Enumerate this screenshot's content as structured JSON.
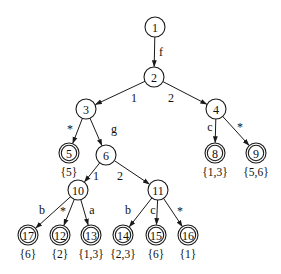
{
  "diagram": {
    "type": "tree",
    "nodes": [
      {
        "id": "1",
        "x": 155,
        "y": 27,
        "final": false
      },
      {
        "id": "2",
        "x": 154,
        "y": 77,
        "final": false
      },
      {
        "id": "3",
        "x": 86,
        "y": 109,
        "final": false
      },
      {
        "id": "4",
        "x": 216,
        "y": 109,
        "final": false
      },
      {
        "id": "5",
        "x": 69,
        "y": 153,
        "final": true,
        "set": "{5}"
      },
      {
        "id": "6",
        "x": 106,
        "y": 155,
        "final": false
      },
      {
        "id": "8",
        "x": 215,
        "y": 153,
        "final": true,
        "set": "{1,3}"
      },
      {
        "id": "9",
        "x": 256,
        "y": 153,
        "final": true,
        "set": "{5,6}"
      },
      {
        "id": "10",
        "x": 78,
        "y": 190,
        "final": false
      },
      {
        "id": "11",
        "x": 158,
        "y": 190,
        "final": false
      },
      {
        "id": "17",
        "x": 28,
        "y": 235,
        "final": true,
        "set": "{6}"
      },
      {
        "id": "12",
        "x": 60,
        "y": 235,
        "final": true,
        "set": "{2}"
      },
      {
        "id": "13",
        "x": 91,
        "y": 235,
        "final": true,
        "set": "{1,3}"
      },
      {
        "id": "14",
        "x": 123,
        "y": 235,
        "final": true,
        "set": "{2,3}"
      },
      {
        "id": "15",
        "x": 156,
        "y": 235,
        "final": true,
        "set": "{6}"
      },
      {
        "id": "16",
        "x": 188,
        "y": 235,
        "final": true,
        "set": "{1}"
      }
    ],
    "edges": [
      {
        "from": "1",
        "to": "2",
        "label": "f",
        "lx": 161,
        "ly": 52
      },
      {
        "from": "2",
        "to": "3",
        "label": "1",
        "lx": 134,
        "ly": 98
      },
      {
        "from": "2",
        "to": "4",
        "label": "2",
        "lx": 171,
        "ly": 98
      },
      {
        "from": "3",
        "to": "5",
        "label": "*",
        "lx": 70,
        "ly": 129
      },
      {
        "from": "3",
        "to": "6",
        "label": "g",
        "lx": 114,
        "ly": 129
      },
      {
        "from": "4",
        "to": "8",
        "label": "c",
        "lx": 210,
        "ly": 127
      },
      {
        "from": "4",
        "to": "9",
        "label": "*",
        "lx": 240,
        "ly": 127
      },
      {
        "from": "6",
        "to": "10",
        "label": "1",
        "lx": 96,
        "ly": 176
      },
      {
        "from": "6",
        "to": "11",
        "label": "2",
        "lx": 120,
        "ly": 176
      },
      {
        "from": "10",
        "to": "17",
        "label": "b",
        "lx": 42,
        "ly": 210
      },
      {
        "from": "10",
        "to": "12",
        "label": "*",
        "lx": 63,
        "ly": 211
      },
      {
        "from": "10",
        "to": "13",
        "label": "a",
        "lx": 92,
        "ly": 210
      },
      {
        "from": "11",
        "to": "14",
        "label": "b",
        "lx": 128,
        "ly": 210
      },
      {
        "from": "11",
        "to": "15",
        "label": "c",
        "lx": 153,
        "ly": 210
      },
      {
        "from": "11",
        "to": "16",
        "label": "*",
        "lx": 180,
        "ly": 211
      }
    ]
  }
}
